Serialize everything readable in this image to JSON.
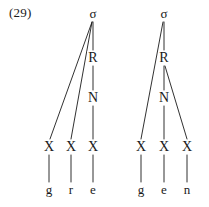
{
  "figure": {
    "example_number": "(29)",
    "caption": "",
    "ink_color": "#1a1a1a",
    "background_color": "#ffffff"
  },
  "trees": [
    {
      "id": "tree-left",
      "word": "gre",
      "nodes": [
        {
          "id": "L-sigma",
          "label": "σ",
          "kind": "sigma",
          "x": 93,
          "y": 14
        },
        {
          "id": "L-R",
          "label": "R",
          "kind": "internal",
          "x": 93,
          "y": 58
        },
        {
          "id": "L-N",
          "label": "N",
          "kind": "internal",
          "x": 93,
          "y": 98
        },
        {
          "id": "L-X1",
          "label": "X",
          "kind": "skeletal",
          "x": 49,
          "y": 147
        },
        {
          "id": "L-X2",
          "label": "X",
          "kind": "skeletal",
          "x": 71,
          "y": 147
        },
        {
          "id": "L-X3",
          "label": "X",
          "kind": "skeletal",
          "x": 93,
          "y": 147
        },
        {
          "id": "L-seg1",
          "label": "g",
          "kind": "terminal",
          "x": 49,
          "y": 190
        },
        {
          "id": "L-seg2",
          "label": "r",
          "kind": "terminal",
          "x": 71,
          "y": 190
        },
        {
          "id": "L-seg3",
          "label": "e",
          "kind": "terminal",
          "x": 93,
          "y": 190
        }
      ],
      "edges": [
        {
          "from": "L-sigma",
          "to": "L-X1",
          "x1": 92,
          "y1": 22,
          "x2": 50,
          "y2": 139
        },
        {
          "from": "L-sigma",
          "to": "L-X2",
          "x1": 92,
          "y1": 22,
          "x2": 71,
          "y2": 139
        },
        {
          "from": "L-sigma",
          "to": "L-R",
          "x1": 93,
          "y1": 22,
          "x2": 93,
          "y2": 50
        },
        {
          "from": "L-R",
          "to": "L-N",
          "x1": 93,
          "y1": 66,
          "x2": 93,
          "y2": 90
        },
        {
          "from": "L-N",
          "to": "L-X3",
          "x1": 93,
          "y1": 106,
          "x2": 93,
          "y2": 139
        },
        {
          "from": "L-X1",
          "to": "L-seg1",
          "x1": 49,
          "y1": 155,
          "x2": 49,
          "y2": 182
        },
        {
          "from": "L-X2",
          "to": "L-seg2",
          "x1": 71,
          "y1": 155,
          "x2": 71,
          "y2": 182
        },
        {
          "from": "L-X3",
          "to": "L-seg3",
          "x1": 93,
          "y1": 155,
          "x2": 93,
          "y2": 182
        }
      ]
    },
    {
      "id": "tree-right",
      "word": "gen",
      "nodes": [
        {
          "id": "R-sigma",
          "label": "σ",
          "kind": "sigma",
          "x": 164,
          "y": 14
        },
        {
          "id": "R-R",
          "label": "R",
          "kind": "internal",
          "x": 164,
          "y": 58
        },
        {
          "id": "R-N",
          "label": "N",
          "kind": "internal",
          "x": 164,
          "y": 98
        },
        {
          "id": "R-X1",
          "label": "X",
          "kind": "skeletal",
          "x": 141,
          "y": 147
        },
        {
          "id": "R-X2",
          "label": "X",
          "kind": "skeletal",
          "x": 164,
          "y": 147
        },
        {
          "id": "R-X3",
          "label": "X",
          "kind": "skeletal",
          "x": 187,
          "y": 147
        },
        {
          "id": "R-seg1",
          "label": "g",
          "kind": "terminal",
          "x": 141,
          "y": 190
        },
        {
          "id": "R-seg2",
          "label": "e",
          "kind": "terminal",
          "x": 164,
          "y": 190
        },
        {
          "id": "R-seg3",
          "label": "n",
          "kind": "terminal",
          "x": 187,
          "y": 190
        }
      ],
      "edges": [
        {
          "from": "R-sigma",
          "to": "R-X1",
          "x1": 163,
          "y1": 22,
          "x2": 141,
          "y2": 139
        },
        {
          "from": "R-sigma",
          "to": "R-R",
          "x1": 164,
          "y1": 22,
          "x2": 164,
          "y2": 50
        },
        {
          "from": "R-R",
          "to": "R-N",
          "x1": 164,
          "y1": 66,
          "x2": 164,
          "y2": 90
        },
        {
          "from": "R-R",
          "to": "R-X3",
          "x1": 165,
          "y1": 66,
          "x2": 187,
          "y2": 139
        },
        {
          "from": "R-N",
          "to": "R-X2",
          "x1": 164,
          "y1": 106,
          "x2": 164,
          "y2": 139
        },
        {
          "from": "R-X1",
          "to": "R-seg1",
          "x1": 141,
          "y1": 155,
          "x2": 141,
          "y2": 182
        },
        {
          "from": "R-X2",
          "to": "R-seg2",
          "x1": 164,
          "y1": 155,
          "x2": 164,
          "y2": 182
        },
        {
          "from": "R-X3",
          "to": "R-seg3",
          "x1": 187,
          "y1": 155,
          "x2": 187,
          "y2": 182
        }
      ]
    }
  ]
}
